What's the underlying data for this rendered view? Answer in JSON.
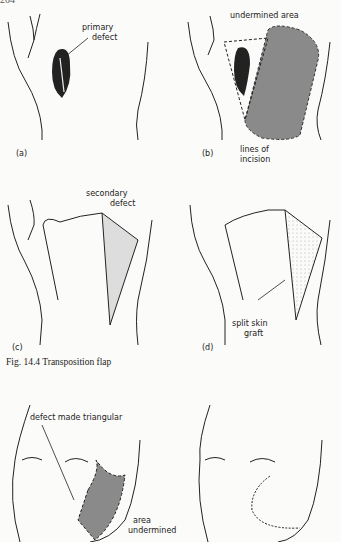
{
  "page": {
    "header_fragment": "204"
  },
  "figure_14_4": {
    "caption": "Fig. 14.4  Transposition flap",
    "panels": [
      {
        "id": "a",
        "label": "(a)",
        "annotations": [
          "primary",
          "defect"
        ]
      },
      {
        "id": "b",
        "label": "(b)",
        "annotations": [
          "undermined area",
          "lines of",
          "incision"
        ]
      },
      {
        "id": "c",
        "label": "(c)",
        "annotations": [
          "secondary",
          "defect"
        ]
      },
      {
        "id": "d",
        "label": "(d)",
        "annotations": [
          "split skin",
          "graft"
        ]
      }
    ]
  },
  "face_figure": {
    "left": {
      "annotations": [
        "defect made triangular",
        "area",
        "undermined"
      ]
    },
    "right": {
      "annotations": []
    }
  },
  "colors": {
    "shaded_area": "#8a8a8a",
    "line": "#222222",
    "paper": "#fbfbf9"
  }
}
